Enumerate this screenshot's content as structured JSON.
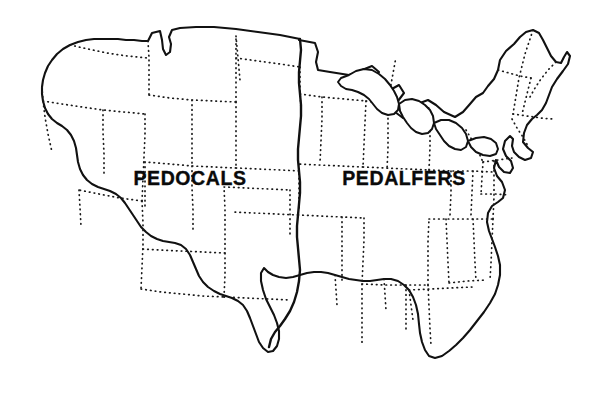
{
  "figure": {
    "kind": "soil-order-map",
    "background_color": "#ffffff",
    "ink_color": "#111111",
    "width": 603,
    "height": 400
  },
  "labels": {
    "west_region": "PEDOCALS",
    "east_region": "PEDALFERS"
  },
  "label_positions": {
    "west": {
      "x": 190,
      "y": 180
    },
    "east": {
      "x": 404,
      "y": 180
    }
  },
  "map_geometry": {
    "coastline_outline": "M 148 41 L 152 33 L 160 31 L 162 40 L 163 49 L 166 55 L 170 52 L 171 44 L 169 37 L 172 30 L 180 28 L 196 27 L 214 27 L 236 29 L 258 32 L 280 35 L 300 39 L 299 40 L 315 43 L 318 52 L 316 62 L 318 70 L 330 72 L 349 75 L 362 70 L 372 66 L 379 72 L 372 80 L 368 89 L 377 93 L 390 90 L 399 85 L 404 93 L 398 101 L 395 112 L 403 118 L 412 116 L 417 110 L 420 103 L 428 100 L 436 105 L 444 112 L 455 117 L 463 112 L 470 104 L 476 97 L 483 93 L 488 86 L 494 79 L 498 70 L 500 60 L 506 51 L 514 44 L 520 37 L 526 32 L 533 30 L 539 33 L 543 40 L 547 48 L 551 56 L 556 62 L 561 63 L 564 57 L 567 52 L 570 56 L 568 64 L 563 71 L 557 79 L 552 87 L 549 95 L 546 103 L 542 110 L 537 115 L 532 119 L 527 125 L 524 133 L 523 142 L 528 148 L 533 152 L 531 158 L 525 160 L 519 157 L 514 152 L 512 146 L 513 139 L 510 136 L 505 141 L 503 149 L 506 156 L 511 161 L 513 168 L 510 173 L 504 172 L 499 167 L 496 160 L 494 168 L 497 176 L 502 182 L 505 190 L 503 198 L 498 202 L 492 206 L 488 213 L 487 222 L 489 231 L 492 239 L 495 247 L 498 256 L 500 265 L 500 275 L 498 285 L 495 294 L 490 303 L 484 312 L 477 321 L 470 330 L 463 338 L 456 345 L 449 351 L 442 356 L 435 358 L 429 356 L 425 350 L 422 342 L 420 333 L 419 324 L 418 314 L 416 305 L 413 297 L 409 290 L 404 285 L 398 281 L 391 279 L 384 279 L 377 280 L 370 281 L 363 281 L 356 280 L 349 279 L 342 277 L 335 275 L 328 273 L 321 272 L 314 272 L 307 273 L 300 275 L 293 277 L 286 278 L 279 277 L 273 275 L 268 272 L 264 268 L 261 273 L 261 281 L 263 290 L 266 299 L 270 307 L 274 315 L 277 323 L 279 331 L 279 339 L 277 346 L 273 351 L 268 352 L 263 348 L 259 342 L 256 334 L 253 326 L 250 318 L 247 311 L 243 305 L 238 301 L 232 298 L 226 296 L 220 294 L 214 291 L 208 287 L 203 282 L 199 276 L 196 269 L 193 262 L 190 255 L 186 249 L 181 245 L 175 243 L 169 242 L 163 241 L 157 239 L 151 236 L 146 232 L 141 227 L 137 221 L 133 215 L 129 209 L 125 203 L 121 198 L 116 194 L 110 191 L 104 189 L 98 187 L 92 184 L 87 180 L 83 175 L 80 169 L 78 162 L 77 155 L 76 148 L 74 141 L 71 135 L 67 130 L 62 126 L 57 123 L 52 119 L 48 114 L 45 108 L 43 101 L 42 94 L 42 87 L 43 80 L 45 73 L 48 66 L 52 60 L 57 54 L 63 49 L 70 45 L 78 42 L 86 40 L 94 39 L 102 39 L 110 39 L 118 39 L 126 40 L 134 40 L 142 41 Z",
    "california_coast_note": "San Francisco Bay notch near x=43,y=185",
    "great_lakes": [
      "M 349 75 L 356 71 L 364 69 L 372 70 L 379 74 L 385 79 L 390 85 L 394 91 L 397 97 L 399 104 L 398 110 L 394 114 L 388 115 L 382 113 L 377 109 L 373 104 L 369 99 L 364 95 L 358 92 L 352 90 L 346 89 L 341 86 L 338 82 L 341 78 Z",
      "M 399 104 L 405 100 L 412 99 L 419 101 L 425 105 L 430 110 L 433 116 L 434 123 L 432 129 L 428 133 L 422 134 L 416 132 L 411 128 L 407 123 L 403 117 L 400 111 Z",
      "M 434 123 L 441 120 L 449 120 L 456 123 L 462 128 L 466 134 L 468 141 L 466 147 L 461 150 L 455 149 L 449 146 L 444 141 L 440 135 L 436 129 Z",
      "M 468 141 L 476 138 L 484 137 L 491 139 L 496 143 L 498 149 L 496 154 L 490 156 L 483 155 L 476 152 L 471 147 Z"
    ],
    "divide_line": "M 300 39 L 301 50 L 300 61 L 299 72 L 299 83 L 300 94 L 301 105 L 301 116 L 300 127 L 299 138 L 298 149 L 298 160 L 299 171 L 300 182 L 300 193 L 299 204 L 298 215 L 297 226 L 297 237 L 298 248 L 299 259 L 300 270 L 299 281 L 297 292 L 294 302 L 290 311 L 285 319 L 280 326 L 275 332 L 271 339 L 269 347",
    "state_borders": [
      "M 70 45 L 88 49 L 107 53 L 127 56 L 148 58",
      "M 148 41 L 149 58 L 149 76 L 149 95",
      "M 43 101 L 62 104 L 82 107 L 103 110 L 124 112 L 145 114",
      "M 145 114 L 145 135 L 144 157 L 143 179 L 142 201",
      "M 42 87 L 43 101 L 45 117 L 48 134 L 52 152",
      "M 142 201 L 120 198 L 99 194 L 79 190",
      "M 142 201 L 143 223 L 143 245 L 142 267 L 141 289",
      "M 141 289 L 161 292 L 182 294 L 203 296 L 224 297",
      "M 149 95 L 170 98 L 192 100 L 214 101 L 236 102",
      "M 236 102 L 236 124 L 236 146 L 236 168",
      "M 236 168 L 214 167 L 192 166 L 170 164 L 145 162",
      "M 236 102 L 236 80 L 236 58 L 236 36",
      "M 224 297 L 225 275 L 225 253 L 225 231 L 225 209 L 224 187",
      "M 224 187 L 246 188 L 268 189 L 290 190",
      "M 236 168 L 258 169 L 280 170 L 299 171",
      "M 236 58 L 258 61 L 280 64 L 300 67",
      "M 298 215 L 276 214 L 254 213 L 232 212",
      "M 224 297 L 246 298 L 268 299 L 290 300",
      "M 300 94 L 322 97 L 344 99 L 366 101",
      "M 366 101 L 365 123 L 364 145 L 363 167",
      "M 363 167 L 341 166 L 319 165 L 299 164",
      "M 363 167 L 385 168 L 407 169 L 429 170",
      "M 366 101 L 388 104 L 410 106 L 430 108",
      "M 429 170 L 430 148 L 430 126 L 430 108",
      "M 298 215 L 320 216 L 342 217 L 364 218",
      "M 364 218 L 364 240 L 363 262 L 362 284",
      "M 362 284 L 384 285 L 406 285 L 428 285",
      "M 428 285 L 428 263 L 428 241 L 429 219",
      "M 429 219 L 451 219 L 473 219 L 493 219",
      "M 429 170 L 451 171 L 473 171 L 492 172",
      "M 493 219 L 494 197 L 494 175 L 494 160",
      "M 362 284 L 362 306 L 362 328 L 362 344",
      "M 428 285 L 429 307 L 430 329 L 431 345",
      "M 493 219 L 492 241 L 491 263 L 490 280",
      "M 446 219 L 447 241 L 448 263 L 449 283",
      "M 449 283 L 468 281 L 487 280",
      "M 466 130 L 472 140 L 478 151 L 483 162",
      "M 483 162 L 498 160 L 512 158",
      "M 483 162 L 482 178 L 481 194",
      "M 481 194 L 496 194 L 509 195",
      "M 512 119 L 517 128 L 523 137 L 528 146",
      "M 533 30 L 529 42 L 525 54 L 522 66 L 519 78 L 517 90 L 515 102 L 513 114",
      "M 513 114 L 527 116 L 541 118 L 552 119",
      "M 498 70 L 509 73 L 520 76 L 531 78",
      "M 531 78 L 528 90 L 525 102 L 522 114",
      "M 556 62 L 548 70 L 541 79 L 535 88 L 530 97",
      "M 390 90 L 392 79 L 394 68 L 396 57",
      "M 299 164 L 299 186 L 299 208",
      "M 290 190 L 290 212 L 290 234",
      "M 335 275 L 336 290 L 337 305",
      "M 384 279 L 385 295 L 386 310",
      "M 409 290 L 411 305 L 413 320",
      "M 300 67 L 300 89 L 301 111",
      "M 236 36 L 238 58 L 240 80",
      "M 145 162 L 145 184 L 145 206",
      "M 79 190 L 80 208 L 81 226",
      "M 103 110 L 103 132 L 104 154 L 104 176",
      "M 192 100 L 192 122 L 192 144 L 192 166",
      "M 192 166 L 192 188 L 193 210 L 193 232",
      "M 225 253 L 203 252 L 181 251 L 159 250 L 141 249",
      "M 322 97 L 322 119 L 321 141 L 320 163",
      "M 388 104 L 388 126 L 388 148 L 387 170",
      "M 451 171 L 451 193 L 450 215",
      "M 473 171 L 472 193 L 471 215",
      "M 342 217 L 342 239 L 342 261 L 342 283",
      "M 406 285 L 406 307 L 406 329",
      "M 473 219 L 474 241 L 475 263 L 476 281",
      "M 409 290 L 430 289 L 451 288 L 472 287"
    ]
  }
}
